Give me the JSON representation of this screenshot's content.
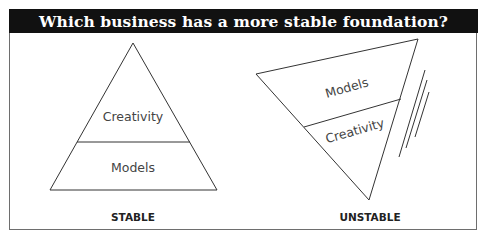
{
  "title": "Which business has a more stable foundation?",
  "left_diagram": {
    "shape": "upright-triangle",
    "top_section_label": "Creativity",
    "bottom_section_label": "Models",
    "caption": "STABLE"
  },
  "right_diagram": {
    "shape": "inverted-tilted-triangle",
    "top_section_label": "Models",
    "bottom_section_label": "Creativity",
    "caption": "UNSTABLE",
    "motion_lines": 3
  },
  "colors": {
    "title_bar": "#111111",
    "title_text": "#ffffff",
    "line": "#333333",
    "label_text": "#444444"
  }
}
